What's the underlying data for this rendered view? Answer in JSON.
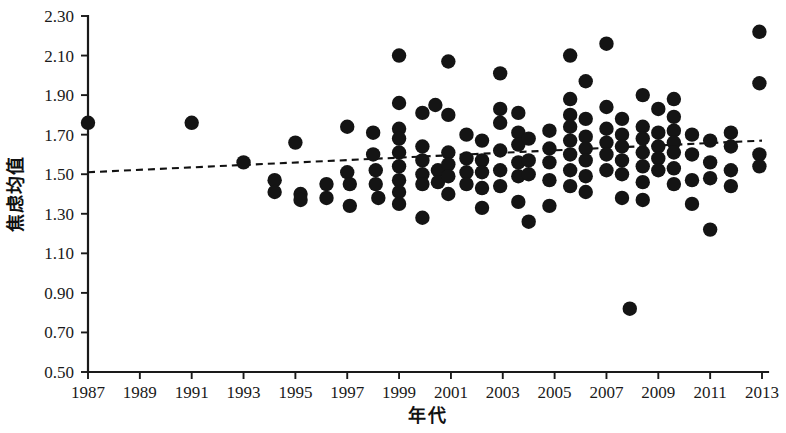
{
  "chart_data": {
    "type": "scatter",
    "title": "",
    "xlabel": "年代",
    "ylabel": "焦虑均值",
    "xlim": [
      1986,
      2014
    ],
    "ylim": [
      0.5,
      2.3
    ],
    "grid": false,
    "legend": null,
    "x_ticks": [
      1987,
      1989,
      1991,
      1993,
      1995,
      1997,
      1999,
      2001,
      2003,
      2005,
      2007,
      2009,
      2011,
      2013
    ],
    "x_tick_labels": [
      "1987",
      "1989",
      "1991",
      "1993",
      "1995",
      "1997",
      "1999",
      "2001",
      "2003",
      "2005",
      "2007",
      "2009",
      "2011",
      "2013"
    ],
    "y_ticks": [
      0.5,
      0.7,
      0.9,
      1.1,
      1.3,
      1.5,
      1.7,
      1.9,
      2.1,
      2.3
    ],
    "y_tick_labels": [
      "0.50",
      "0.70",
      "0.90",
      "1.10",
      "1.30",
      "1.50",
      "1.70",
      "1.90",
      "2.10",
      "2.30"
    ],
    "marker": {
      "shape": "circle",
      "color": "#141414",
      "size": 7.2
    },
    "trendline": {
      "style": "dashed",
      "color": "#111111",
      "x_start": 1987,
      "y_start": 1.51,
      "x_end": 2013,
      "y_end": 1.67
    },
    "points": [
      [
        1987.0,
        1.76
      ],
      [
        1991.0,
        1.76
      ],
      [
        1993.0,
        1.56
      ],
      [
        1994.2,
        1.47
      ],
      [
        1994.2,
        1.41
      ],
      [
        1995.0,
        1.66
      ],
      [
        1995.2,
        1.4
      ],
      [
        1995.2,
        1.37
      ],
      [
        1996.2,
        1.45
      ],
      [
        1996.2,
        1.38
      ],
      [
        1997.0,
        1.74
      ],
      [
        1997.0,
        1.51
      ],
      [
        1997.1,
        1.45
      ],
      [
        1997.1,
        1.34
      ],
      [
        1998.0,
        1.71
      ],
      [
        1998.0,
        1.6
      ],
      [
        1998.1,
        1.52
      ],
      [
        1998.1,
        1.45
      ],
      [
        1998.2,
        1.38
      ],
      [
        1999.0,
        2.1
      ],
      [
        1999.0,
        1.86
      ],
      [
        1999.0,
        1.73
      ],
      [
        1999.0,
        1.68
      ],
      [
        1999.0,
        1.61
      ],
      [
        1999.0,
        1.54
      ],
      [
        1999.0,
        1.47
      ],
      [
        1999.0,
        1.41
      ],
      [
        1999.0,
        1.35
      ],
      [
        1999.9,
        1.81
      ],
      [
        1999.9,
        1.64
      ],
      [
        1999.9,
        1.57
      ],
      [
        1999.9,
        1.5
      ],
      [
        1999.9,
        1.45
      ],
      [
        1999.9,
        1.28
      ],
      [
        2000.4,
        1.85
      ],
      [
        2000.5,
        1.52
      ],
      [
        2000.5,
        1.46
      ],
      [
        2000.9,
        2.07
      ],
      [
        2000.9,
        1.8
      ],
      [
        2000.9,
        1.61
      ],
      [
        2000.9,
        1.55
      ],
      [
        2000.9,
        1.49
      ],
      [
        2000.9,
        1.4
      ],
      [
        2001.6,
        1.7
      ],
      [
        2001.6,
        1.58
      ],
      [
        2001.6,
        1.51
      ],
      [
        2001.6,
        1.45
      ],
      [
        2002.2,
        1.67
      ],
      [
        2002.2,
        1.57
      ],
      [
        2002.2,
        1.51
      ],
      [
        2002.2,
        1.43
      ],
      [
        2002.2,
        1.33
      ],
      [
        2002.9,
        2.01
      ],
      [
        2002.9,
        1.83
      ],
      [
        2002.9,
        1.76
      ],
      [
        2002.9,
        1.62
      ],
      [
        2002.9,
        1.52
      ],
      [
        2002.9,
        1.44
      ],
      [
        2003.6,
        1.81
      ],
      [
        2003.6,
        1.71
      ],
      [
        2003.6,
        1.65
      ],
      [
        2003.6,
        1.56
      ],
      [
        2003.6,
        1.49
      ],
      [
        2003.6,
        1.36
      ],
      [
        2004.0,
        1.68
      ],
      [
        2004.0,
        1.57
      ],
      [
        2004.0,
        1.5
      ],
      [
        2004.0,
        1.26
      ],
      [
        2004.8,
        1.72
      ],
      [
        2004.8,
        1.63
      ],
      [
        2004.8,
        1.56
      ],
      [
        2004.8,
        1.47
      ],
      [
        2004.8,
        1.34
      ],
      [
        2005.6,
        2.1
      ],
      [
        2005.6,
        1.88
      ],
      [
        2005.6,
        1.8
      ],
      [
        2005.6,
        1.74
      ],
      [
        2005.6,
        1.67
      ],
      [
        2005.6,
        1.6
      ],
      [
        2005.6,
        1.52
      ],
      [
        2005.6,
        1.44
      ],
      [
        2006.2,
        1.97
      ],
      [
        2006.2,
        1.78
      ],
      [
        2006.2,
        1.69
      ],
      [
        2006.2,
        1.63
      ],
      [
        2006.2,
        1.57
      ],
      [
        2006.2,
        1.49
      ],
      [
        2006.2,
        1.41
      ],
      [
        2007.0,
        2.16
      ],
      [
        2007.0,
        1.84
      ],
      [
        2007.0,
        1.73
      ],
      [
        2007.0,
        1.66
      ],
      [
        2007.0,
        1.6
      ],
      [
        2007.0,
        1.52
      ],
      [
        2007.6,
        1.78
      ],
      [
        2007.6,
        1.7
      ],
      [
        2007.6,
        1.64
      ],
      [
        2007.6,
        1.57
      ],
      [
        2007.6,
        1.5
      ],
      [
        2007.6,
        1.38
      ],
      [
        2007.9,
        0.82
      ],
      [
        2008.4,
        1.9
      ],
      [
        2008.4,
        1.74
      ],
      [
        2008.4,
        1.68
      ],
      [
        2008.4,
        1.61
      ],
      [
        2008.4,
        1.54
      ],
      [
        2008.4,
        1.46
      ],
      [
        2008.4,
        1.37
      ],
      [
        2009.0,
        1.83
      ],
      [
        2009.0,
        1.71
      ],
      [
        2009.0,
        1.64
      ],
      [
        2009.0,
        1.58
      ],
      [
        2009.0,
        1.52
      ],
      [
        2009.6,
        1.88
      ],
      [
        2009.6,
        1.79
      ],
      [
        2009.6,
        1.72
      ],
      [
        2009.6,
        1.66
      ],
      [
        2009.6,
        1.61
      ],
      [
        2009.6,
        1.53
      ],
      [
        2009.6,
        1.45
      ],
      [
        2010.3,
        1.7
      ],
      [
        2010.3,
        1.6
      ],
      [
        2010.3,
        1.47
      ],
      [
        2010.3,
        1.35
      ],
      [
        2011.0,
        1.67
      ],
      [
        2011.0,
        1.56
      ],
      [
        2011.0,
        1.48
      ],
      [
        2011.0,
        1.22
      ],
      [
        2011.8,
        1.71
      ],
      [
        2011.8,
        1.64
      ],
      [
        2011.8,
        1.52
      ],
      [
        2011.8,
        1.44
      ],
      [
        2012.9,
        2.22
      ],
      [
        2012.9,
        1.96
      ],
      [
        2012.9,
        1.6
      ],
      [
        2012.9,
        1.54
      ]
    ]
  },
  "geometry": {
    "plot_left": 88,
    "plot_right": 768,
    "plot_top": 16,
    "plot_bottom": 372
  }
}
